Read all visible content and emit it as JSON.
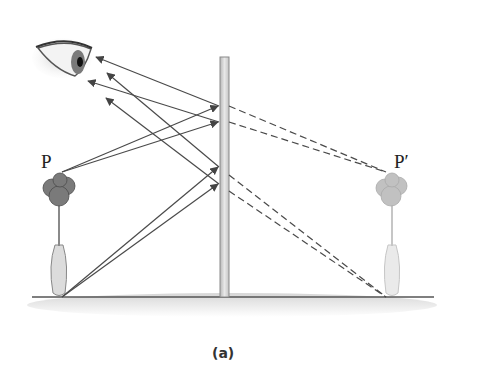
{
  "figure": {
    "caption": "(a)",
    "object_label": "P",
    "image_label": "P′"
  },
  "elements": {
    "eye": "eye-icon",
    "mirror": "plane-mirror",
    "object": "rose-in-vase",
    "image": "rose-in-vase-image",
    "ground": "ground-line"
  },
  "colors": {
    "ray": "#4a4a4a",
    "mirror_fill": "#d8d8d8",
    "mirror_edge": "#8a8a8a",
    "rose": "#7a7a7a",
    "rose_image": "#b5b5b5",
    "ground": "#555555",
    "ground_shadow": "#e2e2e2"
  }
}
